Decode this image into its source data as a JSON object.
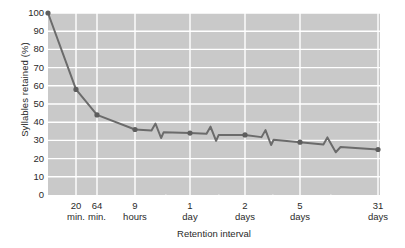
{
  "chart_data": {
    "type": "line",
    "title": "",
    "xlabel": "Retention interval",
    "ylabel": "Syllables retained (%)",
    "ylim": [
      0,
      100
    ],
    "ytick_labels": [
      "100",
      "90",
      "80",
      "70",
      "60",
      "50",
      "40",
      "30",
      "20",
      "10",
      "0"
    ],
    "ytick_values": [
      100,
      90,
      80,
      70,
      60,
      50,
      40,
      30,
      20,
      10,
      0
    ],
    "grid": true,
    "legend": "none",
    "axis_breaks": true,
    "categories": [
      "20 min.",
      "64 min.",
      "9 hours",
      "1 day",
      "2 days",
      "5 days",
      "31 days"
    ],
    "xtick_labels": [
      {
        "line1": "20",
        "line2": "min."
      },
      {
        "line1": "64",
        "line2": "min."
      },
      {
        "line1": "9",
        "line2": "hours"
      },
      {
        "line1": "1",
        "line2": "day"
      },
      {
        "line1": "2",
        "line2": "days"
      },
      {
        "line1": "5",
        "line2": "days"
      },
      {
        "line1": "31",
        "line2": "days"
      }
    ],
    "values": [
      58,
      44,
      36,
      34,
      33,
      29,
      25
    ],
    "origin_point": {
      "label": "immediate",
      "value": 100
    },
    "points": [
      {
        "x_label": "immediate",
        "y": 100
      },
      {
        "x_label": "20 min.",
        "y": 58
      },
      {
        "x_label": "64 min.",
        "y": 44
      },
      {
        "x_label": "9 hours",
        "y": 36
      },
      {
        "x_label": "1 day",
        "y": 34
      },
      {
        "x_label": "2 days",
        "y": 33
      },
      {
        "x_label": "5 days",
        "y": 29
      },
      {
        "x_label": "31 days",
        "y": 25
      }
    ],
    "colors": {
      "plot_background": "#c9c9c9",
      "gridline": "#ffffff",
      "line": "#6b6b6b",
      "marker": "#5e5e5e",
      "text": "#2a2a2a",
      "page_background": "#ffffff"
    }
  }
}
